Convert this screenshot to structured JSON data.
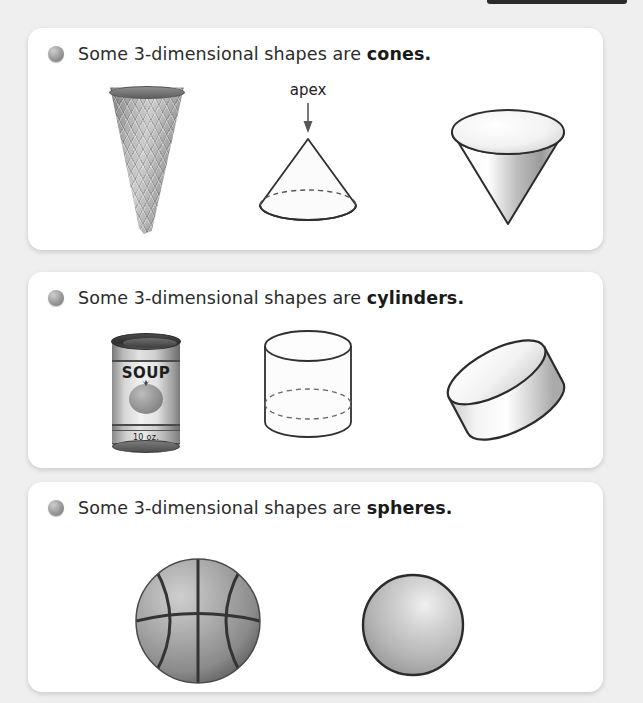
{
  "page": {
    "background_color": "#efefef",
    "card_color": "#ffffff",
    "text_color": "#2b2b2b",
    "top_tab_color": "#2b2b2b"
  },
  "cards": [
    {
      "id": "cones",
      "bullet_icon": "sphere-bullet-icon",
      "sentence_prefix": "Some 3-dimensional shapes are ",
      "sentence_keyword": "cones.",
      "figures": [
        {
          "name": "waffle-ice-cream-cone-photo",
          "label": ""
        },
        {
          "name": "wireframe-cone-diagram",
          "label": "apex"
        },
        {
          "name": "shaded-inverted-cone",
          "label": ""
        }
      ]
    },
    {
      "id": "cylinders",
      "bullet_icon": "sphere-bullet-icon",
      "sentence_prefix": "Some 3-dimensional shapes are ",
      "sentence_keyword": "cylinders.",
      "figures": [
        {
          "name": "soup-can-photo",
          "label": "",
          "can_title": "SOUP",
          "can_weight": "10 oz."
        },
        {
          "name": "wireframe-cylinder-diagram",
          "label": ""
        },
        {
          "name": "shaded-tilted-cylinder",
          "label": ""
        }
      ]
    },
    {
      "id": "spheres",
      "bullet_icon": "sphere-bullet-icon",
      "sentence_prefix": "Some 3-dimensional shapes are ",
      "sentence_keyword": "spheres.",
      "figures": [
        {
          "name": "basketball-photo",
          "label": ""
        },
        {
          "name": "shaded-sphere-diagram",
          "label": ""
        }
      ]
    }
  ]
}
